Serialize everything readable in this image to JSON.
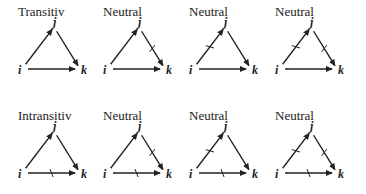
{
  "figure": {
    "rows": [
      {
        "panels": [
          {
            "title": "Transitiv",
            "ticks": {
              "ij": false,
              "jk": false,
              "ik": false
            }
          },
          {
            "title": "Neutral",
            "ticks": {
              "ij": false,
              "jk": true,
              "ik": false
            }
          },
          {
            "title": "Neutral",
            "ticks": {
              "ij": true,
              "jk": false,
              "ik": false
            }
          },
          {
            "title": "Neutral",
            "ticks": {
              "ij": true,
              "jk": true,
              "ik": false
            }
          }
        ]
      },
      {
        "panels": [
          {
            "title": "Intransitiv",
            "ticks": {
              "ij": false,
              "jk": false,
              "ik": true
            }
          },
          {
            "title": "Neutral",
            "ticks": {
              "ij": false,
              "jk": true,
              "ik": true
            }
          },
          {
            "title": "Neutral",
            "ticks": {
              "ij": true,
              "jk": false,
              "ik": true
            }
          },
          {
            "title": "Neutral",
            "ticks": {
              "ij": true,
              "jk": true,
              "ik": true
            }
          }
        ]
      }
    ],
    "node_labels": {
      "i": "i",
      "j": "j",
      "k": "k"
    },
    "edges": [
      "i→j",
      "j→k",
      "i→k"
    ],
    "colors": {
      "ink": "#222222",
      "background": "#ffffff"
    }
  }
}
